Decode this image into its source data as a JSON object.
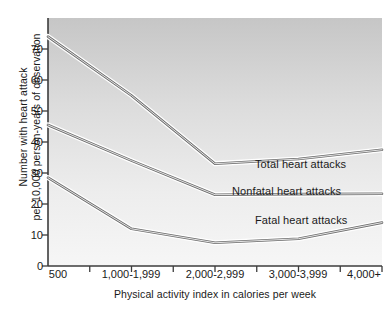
{
  "chart_data": {
    "type": "line",
    "title": "",
    "xlabel": "Physical activity index in calories per week",
    "ylabel_line1": "Number with heart attack",
    "ylabel_line2": "per 10,000 person-years of observation",
    "categories": [
      "500",
      "1,000-1,999",
      "2,000-2,999",
      "3,000-3,999",
      "4,000+"
    ],
    "x_tick_labels": [
      "500",
      "1,000-1,999",
      "2,000-2,999",
      "3,000-3,999",
      "4,000+"
    ],
    "y_tick_labels": [
      "0",
      "10",
      "20",
      "30",
      "40",
      "50",
      "60",
      "70"
    ],
    "y_ticks": [
      0,
      10,
      20,
      30,
      40,
      50,
      60,
      70
    ],
    "ylim": [
      0,
      80
    ],
    "xlim": [
      0,
      8
    ],
    "grid": false,
    "legend_position": "inline-right",
    "series": [
      {
        "name": "Total heart attacks",
        "x": [
          0,
          2,
          4,
          6,
          8
        ],
        "values": [
          74,
          55,
          33,
          34.5,
          37.5
        ]
      },
      {
        "name": "Nonfatal heart attacks",
        "x": [
          0,
          2,
          4,
          6,
          8
        ],
        "values": [
          45.5,
          34,
          23,
          23.2,
          23.3
        ]
      },
      {
        "name": "Fatal heart attacks",
        "x": [
          0,
          2,
          4,
          6,
          8
        ],
        "values": [
          28.5,
          12,
          7.5,
          8.8,
          14
        ]
      }
    ],
    "colors": {
      "line_core": "#6e6e6e",
      "line_edge": "#9a9a9a",
      "axis": "#3c3c3c",
      "plot_bg_top": "#c9c9c9",
      "plot_bg_bottom": "#f4f4f4",
      "text": "#1a1a1a"
    }
  }
}
